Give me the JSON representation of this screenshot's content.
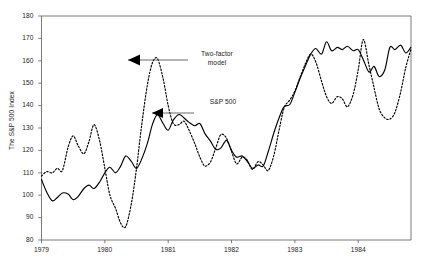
{
  "chart_data": {
    "type": "line",
    "title": "",
    "xlabel": "",
    "ylabel": "The S&P 500 Index",
    "xlim": [
      1979.0,
      1984.833
    ],
    "ylim": [
      80,
      180
    ],
    "ytick_values": [
      80,
      90,
      100,
      110,
      120,
      130,
      140,
      150,
      160,
      170,
      180
    ],
    "ytick_labels": [
      "80",
      "90",
      "100",
      "110",
      "120",
      "130",
      "140",
      "150",
      "160",
      "170",
      "180"
    ],
    "xtick_values": [
      1979,
      1980,
      1981,
      1982,
      1983,
      1984
    ],
    "xtick_labels": [
      "1979",
      "1980",
      "1981",
      "1982",
      "1983",
      "1984"
    ],
    "grid": false,
    "legend": "annotations-with-arrows",
    "annotations": [
      {
        "name": "two-factor-annotation",
        "text": "Two-factor\nmodel",
        "points_to_series": "Two-factor model"
      },
      {
        "name": "sp500-annotation",
        "text": "S&P 500",
        "points_to_series": "S&P 500"
      }
    ],
    "series": [
      {
        "name": "S&P 500",
        "style": "solid",
        "color": "#000000",
        "x": [
          1979.0,
          1979.08,
          1979.17,
          1979.25,
          1979.33,
          1979.42,
          1979.5,
          1979.58,
          1979.67,
          1979.75,
          1979.83,
          1979.92,
          1980.0,
          1980.08,
          1980.17,
          1980.25,
          1980.33,
          1980.42,
          1980.5,
          1980.58,
          1980.67,
          1980.75,
          1980.83,
          1980.92,
          1981.0,
          1981.08,
          1981.17,
          1981.25,
          1981.33,
          1981.42,
          1981.5,
          1981.58,
          1981.67,
          1981.75,
          1981.83,
          1981.92,
          1982.0,
          1982.08,
          1982.17,
          1982.25,
          1982.33,
          1982.42,
          1982.5,
          1982.58,
          1982.67,
          1982.75,
          1982.83,
          1982.92,
          1983.0,
          1983.08,
          1983.17,
          1983.25,
          1983.33,
          1983.42,
          1983.5,
          1983.58,
          1983.67,
          1983.75,
          1983.83,
          1983.92,
          1984.0,
          1984.08,
          1984.17,
          1984.25,
          1984.33,
          1984.42,
          1984.5,
          1984.58,
          1984.67,
          1984.75,
          1984.83
        ],
        "y": [
          107.0,
          101.5,
          97.5,
          99.0,
          101.0,
          100.5,
          98.0,
          99.5,
          103.0,
          104.5,
          103.0,
          106.0,
          110.0,
          112.5,
          110.0,
          113.0,
          117.5,
          115.0,
          112.0,
          116.0,
          123.0,
          131.5,
          136.0,
          132.0,
          129.0,
          133.5,
          136.0,
          134.5,
          132.5,
          131.0,
          132.0,
          127.5,
          124.0,
          120.5,
          121.0,
          124.5,
          120.0,
          117.0,
          117.5,
          115.0,
          112.0,
          113.5,
          113.0,
          119.5,
          128.0,
          134.5,
          139.5,
          140.5,
          146.0,
          152.0,
          158.0,
          163.0,
          165.5,
          163.0,
          168.5,
          164.5,
          166.0,
          165.0,
          166.5,
          164.5,
          165.0,
          160.5,
          155.0,
          157.5,
          153.0,
          156.0,
          166.0,
          165.0,
          167.0,
          163.5,
          166.0
        ]
      },
      {
        "name": "Two-factor model",
        "style": "dashed",
        "color": "#000000",
        "x": [
          1979.0,
          1979.08,
          1979.17,
          1979.25,
          1979.33,
          1979.42,
          1979.5,
          1979.58,
          1979.67,
          1979.75,
          1979.83,
          1979.92,
          1980.0,
          1980.08,
          1980.17,
          1980.25,
          1980.33,
          1980.42,
          1980.5,
          1980.58,
          1980.67,
          1980.75,
          1980.83,
          1980.92,
          1981.0,
          1981.08,
          1981.17,
          1981.25,
          1981.33,
          1981.42,
          1981.5,
          1981.58,
          1981.67,
          1981.75,
          1981.83,
          1981.92,
          1982.0,
          1982.08,
          1982.17,
          1982.25,
          1982.33,
          1982.42,
          1982.5,
          1982.58,
          1982.67,
          1982.75,
          1982.83,
          1982.92,
          1983.0,
          1983.08,
          1983.17,
          1983.25,
          1983.33,
          1983.42,
          1983.5,
          1983.58,
          1983.67,
          1983.75,
          1983.83,
          1983.92,
          1984.0,
          1984.08,
          1984.17,
          1984.25,
          1984.33,
          1984.42,
          1984.5,
          1984.58,
          1984.67,
          1984.75,
          1984.83
        ],
        "y": [
          108.5,
          110.5,
          110.0,
          112.0,
          111.0,
          121.5,
          126.5,
          122.0,
          118.5,
          124.0,
          131.5,
          124.0,
          112.0,
          100.0,
          94.0,
          87.5,
          86.0,
          96.5,
          112.0,
          131.0,
          149.0,
          159.0,
          161.0,
          152.0,
          140.0,
          132.0,
          131.5,
          133.0,
          129.0,
          123.0,
          117.0,
          113.0,
          115.0,
          121.0,
          127.0,
          125.5,
          119.5,
          114.0,
          117.0,
          115.5,
          111.5,
          115.0,
          113.5,
          111.0,
          118.0,
          129.0,
          139.0,
          142.5,
          146.5,
          152.5,
          159.0,
          163.0,
          159.5,
          151.0,
          144.0,
          141.0,
          144.0,
          143.0,
          139.5,
          145.0,
          156.0,
          169.5,
          158.0,
          148.0,
          138.5,
          134.5,
          134.0,
          137.0,
          146.0,
          157.0,
          165.0
        ]
      }
    ]
  }
}
